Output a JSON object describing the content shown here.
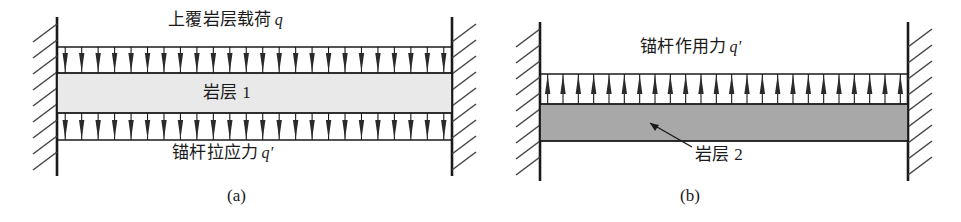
{
  "figure": {
    "type": "engineering-diagram",
    "background_color": "#ffffff",
    "line_color": "#1a1a1a"
  },
  "panels": [
    {
      "id": "a",
      "caption": "(a)",
      "labels": {
        "top_load": {
          "text": "上覆岩层载荷",
          "symbol": "q"
        },
        "beam": {
          "text": "岩层 1"
        },
        "bottom_load": {
          "text": "锚杆拉应力",
          "symbol": "q′"
        }
      },
      "beam": {
        "fill_color": "#e9e9e9",
        "stroke_color": "#1a1a1a"
      },
      "supports": {
        "kind": "fixed-hatched-wall",
        "count": 2,
        "sides": [
          "left",
          "right"
        ]
      },
      "load_rows": [
        {
          "name": "top-distributed-load",
          "direction": "down",
          "arrow_count": 24
        },
        {
          "name": "bottom-distributed-load",
          "direction": "down",
          "arrow_count": 24
        }
      ]
    },
    {
      "id": "b",
      "caption": "(b)",
      "labels": {
        "top_load": {
          "text": "锚杆作用力",
          "symbol": "q′"
        },
        "beam": {
          "text": "岩层 2"
        }
      },
      "beam": {
        "fill_color": "#a8a8a8",
        "stroke_color": "#1a1a1a"
      },
      "supports": {
        "kind": "fixed-hatched-wall",
        "count": 2,
        "sides": [
          "left",
          "right"
        ]
      },
      "load_rows": [
        {
          "name": "top-distributed-load",
          "direction": "up",
          "arrow_count": 24
        }
      ],
      "leader_line": {
        "name": "beam-leader-line",
        "points": "from label up-left to beam interior"
      }
    }
  ],
  "chart_data": {
    "type": "diagram",
    "title": "",
    "panels": [
      {
        "label": "(a)",
        "beam_name": "岩层 1",
        "loads": [
          {
            "position": "top",
            "direction": "down",
            "magnitude_symbol": "q",
            "caption": "上覆岩层载荷 q",
            "arrows": 24
          },
          {
            "position": "bottom",
            "direction": "down",
            "magnitude_symbol": "q′",
            "caption": "锚杆拉应力 q′",
            "arrows": 24
          }
        ],
        "beam_fill": "#e9e9e9",
        "boundary_conditions": [
          "fixed-left",
          "fixed-right"
        ]
      },
      {
        "label": "(b)",
        "beam_name": "岩层 2",
        "loads": [
          {
            "position": "top",
            "direction": "up",
            "magnitude_symbol": "q′",
            "caption": "锚杆作用力 q′",
            "arrows": 24
          }
        ],
        "beam_fill": "#a8a8a8",
        "boundary_conditions": [
          "fixed-left",
          "fixed-right"
        ]
      }
    ]
  }
}
